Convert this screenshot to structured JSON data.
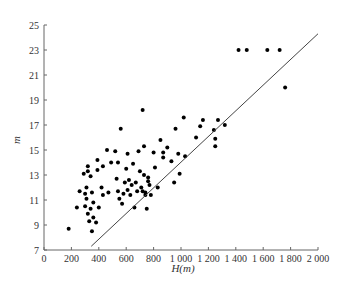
{
  "chart_data": {
    "type": "scatter",
    "title": "",
    "xlabel": "H(m)",
    "ylabel": "m",
    "xlim": [
      0,
      2000
    ],
    "ylim": [
      7,
      25
    ],
    "x_ticks": [
      0,
      200,
      400,
      600,
      800,
      1000,
      1200,
      1400,
      1600,
      1800,
      2000
    ],
    "x_tick_labels": [
      "0",
      "200",
      "400",
      "600",
      "800",
      "1 000",
      "1 200",
      "1 400",
      "1 600",
      "1 800",
      "2 000"
    ],
    "y_ticks": [
      7,
      9,
      11,
      13,
      15,
      17,
      19,
      21,
      23,
      25
    ],
    "y_tick_labels": [
      "7",
      "9",
      "11",
      "13",
      "15",
      "17",
      "19",
      "21",
      "23",
      "25"
    ],
    "grid": false,
    "legend": null,
    "series": [
      {
        "name": "observations",
        "kind": "scatter",
        "points": [
          [
            180,
            8.7
          ],
          [
            240,
            10.4
          ],
          [
            260,
            11.7
          ],
          [
            290,
            13.1
          ],
          [
            300,
            11.5
          ],
          [
            300,
            10.5
          ],
          [
            310,
            12.0
          ],
          [
            310,
            11.1
          ],
          [
            320,
            13.7
          ],
          [
            320,
            13.3
          ],
          [
            320,
            9.9
          ],
          [
            330,
            9.3
          ],
          [
            340,
            10.3
          ],
          [
            340,
            12.9
          ],
          [
            350,
            8.5
          ],
          [
            350,
            11.6
          ],
          [
            360,
            9.6
          ],
          [
            360,
            10.8
          ],
          [
            380,
            9.2
          ],
          [
            390,
            13.4
          ],
          [
            390,
            14.2
          ],
          [
            400,
            10.4
          ],
          [
            420,
            12.0
          ],
          [
            430,
            13.7
          ],
          [
            430,
            11.4
          ],
          [
            460,
            15.0
          ],
          [
            470,
            11.6
          ],
          [
            490,
            14.0
          ],
          [
            520,
            14.9
          ],
          [
            530,
            12.7
          ],
          [
            540,
            11.7
          ],
          [
            540,
            14.0
          ],
          [
            550,
            11.1
          ],
          [
            560,
            16.7
          ],
          [
            570,
            10.7
          ],
          [
            580,
            11.5
          ],
          [
            590,
            12.4
          ],
          [
            600,
            13.5
          ],
          [
            610,
            14.7
          ],
          [
            610,
            11.8
          ],
          [
            620,
            12.6
          ],
          [
            630,
            11.4
          ],
          [
            640,
            12.2
          ],
          [
            650,
            13.9
          ],
          [
            660,
            10.4
          ],
          [
            670,
            12.4
          ],
          [
            680,
            11.7
          ],
          [
            690,
            14.9
          ],
          [
            700,
            13.3
          ],
          [
            710,
            12.0
          ],
          [
            720,
            11.7
          ],
          [
            720,
            18.2
          ],
          [
            730,
            13.0
          ],
          [
            730,
            15.3
          ],
          [
            740,
            11.4
          ],
          [
            740,
            11.6
          ],
          [
            750,
            10.3
          ],
          [
            760,
            12.5
          ],
          [
            760,
            12.8
          ],
          [
            770,
            12.2
          ],
          [
            780,
            11.4
          ],
          [
            800,
            14.8
          ],
          [
            810,
            13.6
          ],
          [
            830,
            12.0
          ],
          [
            850,
            15.8
          ],
          [
            870,
            14.8
          ],
          [
            870,
            14.4
          ],
          [
            900,
            15.2
          ],
          [
            930,
            14.1
          ],
          [
            950,
            12.4
          ],
          [
            960,
            16.7
          ],
          [
            980,
            14.7
          ],
          [
            990,
            13.1
          ],
          [
            1020,
            17.6
          ],
          [
            1030,
            14.5
          ],
          [
            1110,
            16.0
          ],
          [
            1140,
            16.9
          ],
          [
            1160,
            17.4
          ],
          [
            1240,
            16.6
          ],
          [
            1250,
            15.9
          ],
          [
            1250,
            15.3
          ],
          [
            1270,
            17.4
          ],
          [
            1320,
            17.0
          ],
          [
            1420,
            23.0
          ],
          [
            1480,
            23.0
          ],
          [
            1630,
            23.0
          ],
          [
            1720,
            23.0
          ],
          [
            1760,
            20.0
          ]
        ]
      },
      {
        "name": "reference line",
        "kind": "line",
        "points": [
          [
            345,
            7.3
          ],
          [
            2000,
            24.3
          ]
        ]
      }
    ]
  }
}
